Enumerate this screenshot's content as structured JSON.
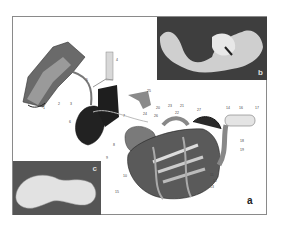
{
  "figure": {
    "panels": [
      {
        "id": "a",
        "letter": "a",
        "description": "Anatomical illustration of digestive tract (oral cavity, esophagus, liver, stomach, intestines, colon)"
      },
      {
        "id": "b",
        "letter": "b",
        "description": "Photograph of intestinal mass on dark background"
      },
      {
        "id": "c",
        "letter": "c",
        "description": "Photograph of coiled intestine segment"
      }
    ],
    "callout_labels": [
      "1",
      "2",
      "3",
      "4",
      "5",
      "6",
      "7",
      "8",
      "9",
      "10",
      "11",
      "12",
      "13",
      "14",
      "15",
      "16",
      "17",
      "18",
      "19",
      "20",
      "21",
      "22",
      "23",
      "24",
      "25",
      "26",
      "27"
    ]
  }
}
